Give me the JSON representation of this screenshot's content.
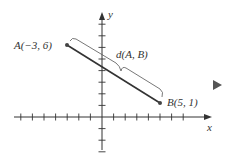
{
  "diagram": {
    "axes": {
      "x_label": "x",
      "y_label": "y",
      "x_ticks": [
        -7,
        -6,
        -5,
        -4,
        -3,
        -2,
        -1,
        1,
        2,
        3,
        4,
        5,
        6,
        7
      ],
      "y_ticks": [
        -3,
        -2,
        -1,
        1,
        2,
        3,
        4,
        5,
        6,
        7,
        8
      ],
      "origin_px": [
        102,
        117
      ],
      "unit_px": 11.6
    },
    "points": [
      {
        "name": "A",
        "label": "A(−3, 6)",
        "x": -3,
        "y": 6
      },
      {
        "name": "B",
        "label": "B(5, 1)",
        "x": 5,
        "y": 1
      }
    ],
    "segment": {
      "from": "A",
      "to": "B",
      "label": "d(A, B)"
    },
    "colors": {
      "line": "#333333",
      "brace": "#555555",
      "axis": "#333333",
      "marker": "#444444"
    },
    "nav_marker": "play-triangle"
  }
}
